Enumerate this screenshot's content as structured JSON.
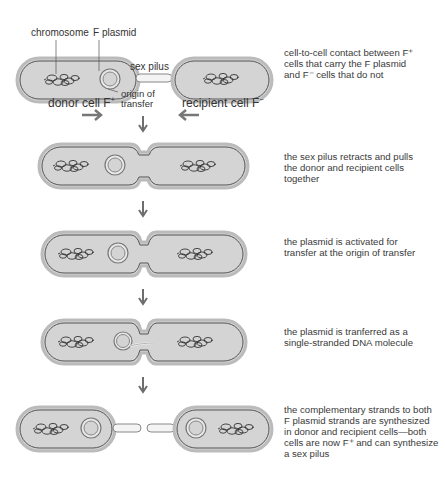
{
  "labels": {
    "chromosome": "chromosome",
    "f_plasmid": "F plasmid",
    "sex_pilus": "sex pilus",
    "origin_line1": "origin of",
    "origin_line2": "transfer",
    "donor": "donor cell F",
    "donor_sup": "+",
    "recipient": "recipient cell F",
    "recipient_sup": "−"
  },
  "steps": [
    {
      "lines": [
        "cell-to-cell contact between F⁺",
        "cells that carry the F plasmid",
        "and F⁻ cells that do not"
      ]
    },
    {
      "lines": [
        "the sex pilus retracts and pulls",
        "the donor and recipient cells",
        "together"
      ]
    },
    {
      "lines": [
        "the plasmid is activated for",
        "transfer at the origin of transfer"
      ]
    },
    {
      "lines": [
        "the plasmid is tranferred as a",
        "single-stranded DNA molecule"
      ]
    },
    {
      "lines": [
        "the complementary strands to both",
        "F plasmid strands are synthesized",
        "in donor and recipient cells—both",
        "cells are now F⁺ and can synthesize",
        "a sex pilus"
      ]
    }
  ],
  "colors": {
    "cell_fill": "#d4d4d4",
    "cell_outline": "#555555",
    "arrow": "#6e6e6e"
  }
}
